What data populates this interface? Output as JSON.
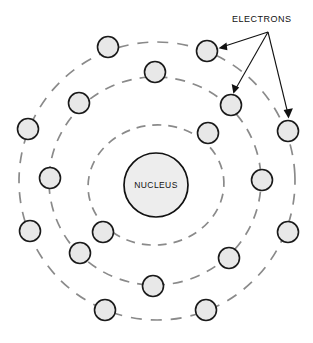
{
  "figure": {
    "background_color": "#ffffff"
  },
  "nucleus": {
    "label": "NUCLEUS",
    "cx": 156,
    "cy": 185,
    "r": 32,
    "fill": "#ededed",
    "stroke": "#111111"
  },
  "callout": {
    "label": "ELECTRONS",
    "text_x": 232,
    "text_y": 22,
    "anchor_x": 268,
    "anchor_y": 32
  },
  "style": {
    "orbit_stroke": "#8a8a8a",
    "electron_fill": "#e8e8e8",
    "electron_stroke": "#1a1a1a",
    "leader_stroke": "#111111",
    "electron_radius": 10.5
  },
  "orbits": [
    {
      "name": "inner-shell",
      "cx": 156,
      "cy": 185,
      "rx": 68,
      "ry": 60,
      "dash": "9 7",
      "rotation": -6
    },
    {
      "name": "middle-shell",
      "cx": 155,
      "cy": 181,
      "rx": 106,
      "ry": 104,
      "dash": "10 8",
      "rotation": -4
    },
    {
      "name": "outer-shell",
      "cx": 157,
      "cy": 181,
      "rx": 138,
      "ry": 139,
      "dash": "11 9",
      "rotation": -3
    }
  ],
  "electrons": [
    {
      "id": 1,
      "shell": "outer-shell",
      "cx": 108,
      "cy": 47
    },
    {
      "id": 2,
      "shell": "outer-shell",
      "cx": 207,
      "cy": 51
    },
    {
      "id": 3,
      "shell": "outer-shell",
      "cx": 28,
      "cy": 129
    },
    {
      "id": 4,
      "shell": "outer-shell",
      "cx": 288,
      "cy": 131
    },
    {
      "id": 5,
      "shell": "outer-shell",
      "cx": 30,
      "cy": 231
    },
    {
      "id": 6,
      "shell": "outer-shell",
      "cx": 288,
      "cy": 232
    },
    {
      "id": 7,
      "shell": "outer-shell",
      "cx": 105,
      "cy": 310
    },
    {
      "id": 8,
      "shell": "outer-shell",
      "cx": 206,
      "cy": 310
    },
    {
      "id": 9,
      "shell": "middle-shell",
      "cx": 79,
      "cy": 103
    },
    {
      "id": 10,
      "shell": "middle-shell",
      "cx": 155,
      "cy": 72
    },
    {
      "id": 11,
      "shell": "middle-shell",
      "cx": 231,
      "cy": 105
    },
    {
      "id": 12,
      "shell": "middle-shell",
      "cx": 50,
      "cy": 178
    },
    {
      "id": 13,
      "shell": "middle-shell",
      "cx": 262,
      "cy": 180
    },
    {
      "id": 14,
      "shell": "middle-shell",
      "cx": 80,
      "cy": 253
    },
    {
      "id": 15,
      "shell": "middle-shell",
      "cx": 229,
      "cy": 258
    },
    {
      "id": 16,
      "shell": "inner-shell",
      "cx": 103,
      "cy": 232
    },
    {
      "id": 17,
      "shell": "inner-shell",
      "cx": 208,
      "cy": 133
    },
    {
      "id": 18,
      "shell": "inner-shell",
      "cx": 153,
      "cy": 286
    }
  ],
  "leaders": [
    {
      "id": "leader-to-top-electron",
      "target_x": 219,
      "target_y": 48,
      "label": "arrow to upper electron"
    },
    {
      "id": "leader-to-mid-electron",
      "target_x": 234,
      "target_y": 93,
      "label": "arrow to middle electron"
    },
    {
      "id": "leader-to-right-electron",
      "target_x": 288,
      "target_y": 118,
      "label": "arrow to right electron"
    }
  ]
}
